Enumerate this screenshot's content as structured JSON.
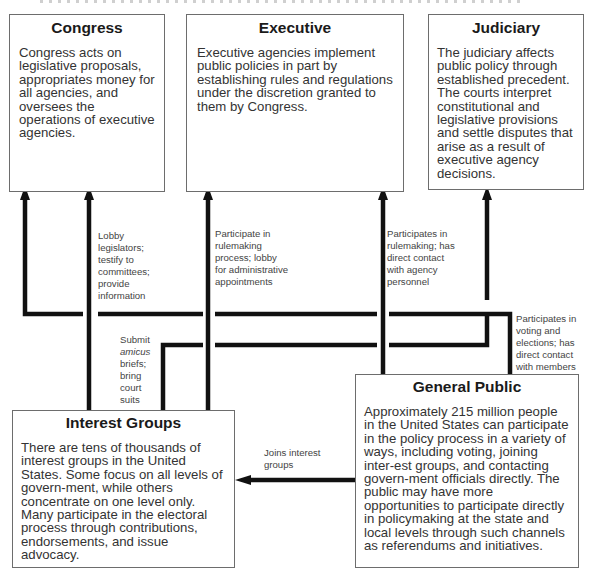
{
  "boxes": {
    "congress": {
      "title": "Congress",
      "body": "Congress acts on legislative proposals, appropriates money for all agencies, and oversees the operations of executive agencies."
    },
    "executive": {
      "title": "Executive",
      "body": "Executive agencies implement public policies in part by establishing rules and regulations under the discretion granted to them by Congress."
    },
    "judiciary": {
      "title": "Judiciary",
      "body": "The judiciary affects public policy through established precedent. The courts interpret constitutional and legislative provisions and settle disputes that arise as a result of executive agency decisions."
    },
    "interest_groups": {
      "title": "Interest Groups",
      "body": "There are tens of thousands of interest groups in the United States. Some focus on all levels of govern-ment, while others concentrate on one level only. Many participate in the electoral process through contributions, endorsements, and issue advocacy."
    },
    "general_public": {
      "title": "General Public",
      "body": "Approximately 215 million people in the United States can participate in the policy process in a variety of ways, including voting, joining inter-est groups, and contacting govern-ment officials directly. The public may have more opportunities to participate directly in policymaking at the state and local levels through such channels as referendums and initiatives."
    }
  },
  "connectors": {
    "lobby_legislators": "Lobby legislators; testify to committees; provide information",
    "participate_rulemaking": "Participate in rulemaking process; lobby for administrative appointments",
    "amicus_prefix": "Submit",
    "amicus_italic": "amicus",
    "amicus_suffix": "briefs; bring court suits",
    "public_rulemaking": "Participates in rulemaking; has direct contact with agency personnel",
    "public_voting": "Participates in voting and elections; has direct contact with members",
    "joins_groups": "Joins interest groups"
  },
  "colors": {
    "line": "#111111",
    "border": "#6d6d6d"
  }
}
